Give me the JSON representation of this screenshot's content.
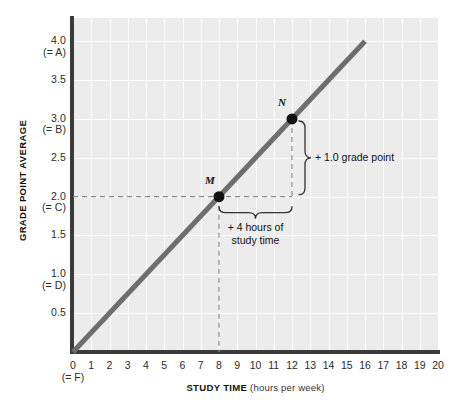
{
  "chart_data": {
    "type": "line",
    "title": "",
    "xlabel_main": "STUDY TIME",
    "xlabel_sub": "(hours per week)",
    "ylabel": "GRADE POINT AVERAGE",
    "xlim": [
      0,
      20
    ],
    "ylim": [
      0,
      4.3
    ],
    "grid": true,
    "legend": "none",
    "xticks": [
      {
        "value": 0,
        "label": "0",
        "grade": "(= F)"
      },
      {
        "value": 1,
        "label": "1",
        "grade": ""
      },
      {
        "value": 2,
        "label": "2",
        "grade": ""
      },
      {
        "value": 3,
        "label": "3",
        "grade": ""
      },
      {
        "value": 4,
        "label": "4",
        "grade": ""
      },
      {
        "value": 5,
        "label": "5",
        "grade": ""
      },
      {
        "value": 6,
        "label": "6",
        "grade": ""
      },
      {
        "value": 7,
        "label": "7",
        "grade": ""
      },
      {
        "value": 8,
        "label": "8",
        "grade": ""
      },
      {
        "value": 9,
        "label": "9",
        "grade": ""
      },
      {
        "value": 10,
        "label": "10",
        "grade": ""
      },
      {
        "value": 11,
        "label": "11",
        "grade": ""
      },
      {
        "value": 12,
        "label": "12",
        "grade": ""
      },
      {
        "value": 13,
        "label": "13",
        "grade": ""
      },
      {
        "value": 14,
        "label": "14",
        "grade": ""
      },
      {
        "value": 15,
        "label": "15",
        "grade": ""
      },
      {
        "value": 16,
        "label": "16",
        "grade": ""
      },
      {
        "value": 17,
        "label": "17",
        "grade": ""
      },
      {
        "value": 18,
        "label": "18",
        "grade": ""
      },
      {
        "value": 19,
        "label": "19",
        "grade": ""
      },
      {
        "value": 20,
        "label": "20",
        "grade": ""
      }
    ],
    "yticks": [
      {
        "value": 0.5,
        "label": "0.5",
        "grade": ""
      },
      {
        "value": 1.0,
        "label": "1.0",
        "grade": "(= D)"
      },
      {
        "value": 1.5,
        "label": "1.5",
        "grade": ""
      },
      {
        "value": 2.0,
        "label": "2.0",
        "grade": "(= C)"
      },
      {
        "value": 2.5,
        "label": "2.5",
        "grade": ""
      },
      {
        "value": 3.0,
        "label": "3.0",
        "grade": "(= B)"
      },
      {
        "value": 3.5,
        "label": "3.5",
        "grade": ""
      },
      {
        "value": 4.0,
        "label": "4.0",
        "grade": "(= A)"
      }
    ],
    "series": [
      {
        "name": "GPA vs study time",
        "color": "#6e6e6e",
        "slope": 0.25,
        "intercept": 0,
        "x": [
          0,
          16
        ],
        "y": [
          0,
          4.0
        ]
      }
    ],
    "points": [
      {
        "label": "M",
        "x": 8,
        "y": 2.0
      },
      {
        "label": "N",
        "x": 12,
        "y": 3.0
      }
    ],
    "annotations": [
      {
        "name": "rise",
        "text": "+ 1.0 grade point",
        "from_y": 2.0,
        "to_y": 3.0,
        "at_x": 12
      },
      {
        "name": "run",
        "text_line1": "+ 4 hours of",
        "text_line2": "study time",
        "from_x": 8,
        "to_x": 12,
        "at_y": 2.0
      }
    ],
    "colors": {
      "plot_background": "#ececec",
      "gridline": "#fdfdfd",
      "axis": "#3b3b3b",
      "line": "#6e6e6e",
      "point": "#111111",
      "guide_dashed": "#8a8a8a",
      "text": "#111111"
    }
  }
}
